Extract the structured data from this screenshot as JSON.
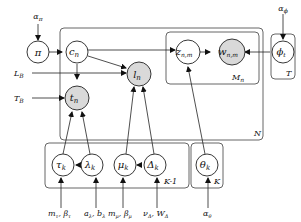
{
  "diagram": {
    "nodes": {
      "pi": {
        "label": "π"
      },
      "c": {
        "label": "c",
        "sub": "n"
      },
      "l": {
        "label": "l",
        "sub": "n"
      },
      "t": {
        "label": "t",
        "sub": "n"
      },
      "z": {
        "label": "z",
        "sub": "n,m"
      },
      "w": {
        "label": "w",
        "sub": "n,m"
      },
      "phi": {
        "label": "ϕ",
        "sub": "t"
      },
      "tau": {
        "label": "τ",
        "sub": "k"
      },
      "lambda": {
        "label": "λ",
        "sub": "k"
      },
      "mu": {
        "label": "μ",
        "sub": "k"
      },
      "delta": {
        "label": "Δ",
        "sub": "k"
      },
      "theta": {
        "label": "θ",
        "sub": "k"
      }
    },
    "hyperparameters": {
      "alpha_pi": "απ",
      "alpha_phi": "αϕ",
      "L_B": "L_B",
      "T_B": "T_B",
      "tau_hp": "mτ, βτ",
      "lambda_hp": "aλ, bλ",
      "mu_hp": "mμ, βμ",
      "delta_hp": "νΔ, WΔ",
      "theta_hp": "αθ"
    },
    "plates": {
      "N": "N",
      "M": "M_n",
      "T": "T",
      "K1": "K-1",
      "K": "K"
    },
    "colors": {
      "observed": "#d9d9d9",
      "latent": "#ffffff",
      "stroke": "#222222"
    }
  }
}
